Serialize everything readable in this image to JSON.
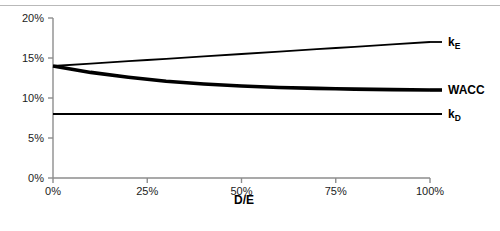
{
  "chart_data": {
    "type": "line",
    "title": "",
    "xlabel": "D/E",
    "ylabel": "",
    "xlim": [
      0,
      100
    ],
    "ylim": [
      0,
      20
    ],
    "grid": false,
    "legend_position": "right-inline",
    "x_tick_labels": [
      "0%",
      "25%",
      "50%",
      "75%",
      "100%"
    ],
    "x_ticks": [
      0,
      25,
      50,
      75,
      100
    ],
    "y_tick_labels": [
      "0%",
      "5%",
      "10%",
      "15%",
      "20%"
    ],
    "y_ticks": [
      0,
      5,
      10,
      15,
      20
    ],
    "x": [
      0,
      10,
      20,
      25,
      30,
      40,
      50,
      60,
      70,
      75,
      80,
      90,
      100
    ],
    "series": [
      {
        "name": "kE",
        "label_main": "k",
        "label_sub": "E",
        "values": [
          14.0,
          14.3,
          14.6,
          14.75,
          14.9,
          15.2,
          15.5,
          15.8,
          16.1,
          16.25,
          16.4,
          16.7,
          17.0
        ],
        "color": "#000000",
        "width": 1.8
      },
      {
        "name": "WACC",
        "label_main": "WACC",
        "label_sub": "",
        "values": [
          14.0,
          13.2,
          12.6,
          12.35,
          12.1,
          11.75,
          11.5,
          11.32,
          11.2,
          11.15,
          11.11,
          11.05,
          11.0
        ],
        "color": "#000000",
        "width": 3.6
      },
      {
        "name": "kD",
        "label_main": "k",
        "label_sub": "D",
        "values": [
          8.0,
          8.0,
          8.0,
          8.0,
          8.0,
          8.0,
          8.0,
          8.0,
          8.0,
          8.0,
          8.0,
          8.0,
          8.0
        ],
        "color": "#000000",
        "width": 2.0
      }
    ],
    "axis_color": "#8d8d8d"
  }
}
